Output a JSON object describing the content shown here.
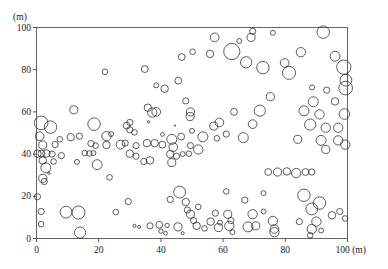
{
  "figure": {
    "type": "bubble-scatter",
    "y_axis_unit_label": "(m)",
    "x_axis_end_label": "100 (m)"
  },
  "axes": {
    "y_ticks": [
      {
        "value": 0,
        "label": "0"
      },
      {
        "value": 20,
        "label": "20"
      },
      {
        "value": 40,
        "label": "40"
      },
      {
        "value": 60,
        "label": "60"
      },
      {
        "value": 80,
        "label": "80"
      },
      {
        "value": 100,
        "label": "100"
      }
    ],
    "x_ticks": [
      {
        "value": 0,
        "label": "0"
      },
      {
        "value": 20,
        "label": "20"
      },
      {
        "value": 40,
        "label": "40"
      },
      {
        "value": 60,
        "label": "60"
      },
      {
        "value": 80,
        "label": "80"
      },
      {
        "value": 100,
        "label": "100 (m)"
      }
    ]
  },
  "chart_data": {
    "type": "scatter",
    "title": "",
    "subtitle": "",
    "xlabel": "(m)",
    "ylabel": "(m)",
    "xlim": [
      0,
      100
    ],
    "ylim": [
      0,
      100
    ],
    "grid": false,
    "legend": null,
    "marker": {
      "shape": "circle",
      "fill": "none",
      "stroke": "#1a1a1a",
      "stroke_width": 0.7,
      "size_encodes": "crown-diameter",
      "size_min_m": 0.6,
      "size_max_m": 4.4
    },
    "axis_unit": "m",
    "point_fields": [
      "x",
      "y",
      "r"
    ],
    "points": [
      [
        69.5,
        98.2,
        1.0
      ],
      [
        69.0,
        95.3,
        1.3
      ],
      [
        76.0,
        97.5,
        0.8
      ],
      [
        92.2,
        97.8,
        2.0
      ],
      [
        57.3,
        95.3,
        1.4
      ],
      [
        65.2,
        93.6,
        0.8
      ],
      [
        55.8,
        87.5,
        1.2
      ],
      [
        62.8,
        88.6,
        2.6
      ],
      [
        46.7,
        86.0,
        1.1
      ],
      [
        50.2,
        88.5,
        0.9
      ],
      [
        85.0,
        88.3,
        1.5
      ],
      [
        96.0,
        86.4,
        1.6
      ],
      [
        67.4,
        83.5,
        1.8
      ],
      [
        72.8,
        81.0,
        2.0
      ],
      [
        79.8,
        83.2,
        1.4
      ],
      [
        34.8,
        80.3,
        1.1
      ],
      [
        81.2,
        78.5,
        2.1
      ],
      [
        98.8,
        81.2,
        2.3
      ],
      [
        22.0,
        79.0,
        0.9
      ],
      [
        45.6,
        74.8,
        1.1
      ],
      [
        99.5,
        75.0,
        1.9
      ],
      [
        99.4,
        71.3,
        2.2
      ],
      [
        41.2,
        71.0,
        1.2
      ],
      [
        38.5,
        72.6,
        0.8
      ],
      [
        88.6,
        71.6,
        0.8
      ],
      [
        93.3,
        70.3,
        1.0
      ],
      [
        75.2,
        67.2,
        1.3
      ],
      [
        48.0,
        65.2,
        1.0
      ],
      [
        89.0,
        64.8,
        1.6
      ],
      [
        96.0,
        65.0,
        1.2
      ],
      [
        12.0,
        61.0,
        1.3
      ],
      [
        35.8,
        62.0,
        1.2
      ],
      [
        37.2,
        59.7,
        1.5
      ],
      [
        38.5,
        60.0,
        1.4
      ],
      [
        49.5,
        60.0,
        1.3
      ],
      [
        49.4,
        57.8,
        1.3
      ],
      [
        63.5,
        60.0,
        1.1
      ],
      [
        71.8,
        60.6,
        1.8
      ],
      [
        86.0,
        60.5,
        1.6
      ],
      [
        91.0,
        58.8,
        1.5
      ],
      [
        99.0,
        59.0,
        1.7
      ],
      [
        1.5,
        54.8,
        2.2
      ],
      [
        4.5,
        52.8,
        2.0
      ],
      [
        18.5,
        54.2,
        2.0
      ],
      [
        29.0,
        53.5,
        1.1
      ],
      [
        30.0,
        55.0,
        1.0
      ],
      [
        36.0,
        55.3,
        0.4
      ],
      [
        44.5,
        53.5,
        0.2
      ],
      [
        57.0,
        53.3,
        1.3
      ],
      [
        58.8,
        55.0,
        1.4
      ],
      [
        69.5,
        54.2,
        1.4
      ],
      [
        88.0,
        54.0,
        1.8
      ],
      [
        93.0,
        52.5,
        1.5
      ],
      [
        97.0,
        52.5,
        1.5
      ],
      [
        30.0,
        51.5,
        1.0
      ],
      [
        31.5,
        50.3,
        0.9
      ],
      [
        40.5,
        49.3,
        0.6
      ],
      [
        50.0,
        51.0,
        0.8
      ],
      [
        61.0,
        49.5,
        1.0
      ],
      [
        1.0,
        48.5,
        1.4
      ],
      [
        11.0,
        48.0,
        1.2
      ],
      [
        13.8,
        48.5,
        1.0
      ],
      [
        7.5,
        47.0,
        0.9
      ],
      [
        22.5,
        48.5,
        1.5
      ],
      [
        24.0,
        49.5,
        0.8
      ],
      [
        43.5,
        47.0,
        1.6
      ],
      [
        46.5,
        48.3,
        1.1
      ],
      [
        53.5,
        48.2,
        1.6
      ],
      [
        58.0,
        47.5,
        0.9
      ],
      [
        66.5,
        47.8,
        1.6
      ],
      [
        84.0,
        47.0,
        1.3
      ],
      [
        91.5,
        46.5,
        1.6
      ],
      [
        97.0,
        46.5,
        1.5
      ],
      [
        99.3,
        44.5,
        1.5
      ],
      [
        2.0,
        44.3,
        1.3
      ],
      [
        6.0,
        44.5,
        1.0
      ],
      [
        17.5,
        45.0,
        1.0
      ],
      [
        19.0,
        44.0,
        0.9
      ],
      [
        22.5,
        44.3,
        1.2
      ],
      [
        27.0,
        44.5,
        1.4
      ],
      [
        28.5,
        45.2,
        1.0
      ],
      [
        32.0,
        44.0,
        1.0
      ],
      [
        35.5,
        45.2,
        1.2
      ],
      [
        38.0,
        45.2,
        1.2
      ],
      [
        40.5,
        44.5,
        1.1
      ],
      [
        44.0,
        43.3,
        1.4
      ],
      [
        49.5,
        44.0,
        1.0
      ],
      [
        52.0,
        42.2,
        1.5
      ],
      [
        93.0,
        42.2,
        1.3
      ],
      [
        0.3,
        40.2,
        1.2
      ],
      [
        1.6,
        40.2,
        1.1
      ],
      [
        3.2,
        40.3,
        1.2
      ],
      [
        5.0,
        40.0,
        1.0
      ],
      [
        8.0,
        39.3,
        1.0
      ],
      [
        15.5,
        40.5,
        0.9
      ],
      [
        17.0,
        40.3,
        0.9
      ],
      [
        18.3,
        40.5,
        0.8
      ],
      [
        30.0,
        40.2,
        1.2
      ],
      [
        32.0,
        39.0,
        1.0
      ],
      [
        43.0,
        40.0,
        1.2
      ],
      [
        45.0,
        39.0,
        1.0
      ],
      [
        47.0,
        40.0,
        0.8
      ],
      [
        49.0,
        40.2,
        0.9
      ],
      [
        2.0,
        37.0,
        1.2
      ],
      [
        5.5,
        36.5,
        0.9
      ],
      [
        13.0,
        36.3,
        0.8
      ],
      [
        19.5,
        35.0,
        1.6
      ],
      [
        34.5,
        36.5,
        1.0
      ],
      [
        36.5,
        37.0,
        1.2
      ],
      [
        43.5,
        36.0,
        1.3
      ],
      [
        3.0,
        33.5,
        1.6
      ],
      [
        4.0,
        31.0,
        0.4
      ],
      [
        74.5,
        31.5,
        1.1
      ],
      [
        77.5,
        31.5,
        1.3
      ],
      [
        80.5,
        31.8,
        1.2
      ],
      [
        83.5,
        31.0,
        1.5
      ],
      [
        86.5,
        31.5,
        1.1
      ],
      [
        88.5,
        31.5,
        1.0
      ],
      [
        2.0,
        28.5,
        1.3
      ],
      [
        2.5,
        27.0,
        1.0
      ],
      [
        23.5,
        29.0,
        0.9
      ],
      [
        0.3,
        19.8,
        1.0
      ],
      [
        46.0,
        22.0,
        1.9
      ],
      [
        61.0,
        22.3,
        0.9
      ],
      [
        73.0,
        21.5,
        0.8
      ],
      [
        86.0,
        20.5,
        2.0
      ],
      [
        29.5,
        17.5,
        1.0
      ],
      [
        43.0,
        18.5,
        1.0
      ],
      [
        48.0,
        17.3,
        1.2
      ],
      [
        67.0,
        18.2,
        1.0
      ],
      [
        91.0,
        16.8,
        2.0
      ],
      [
        52.0,
        15.0,
        0.9
      ],
      [
        88.5,
        14.0,
        1.9
      ],
      [
        1.5,
        12.8,
        1.0
      ],
      [
        9.5,
        12.5,
        1.9
      ],
      [
        13.5,
        12.3,
        2.1
      ],
      [
        25.5,
        12.5,
        0.9
      ],
      [
        48.5,
        13.5,
        1.0
      ],
      [
        49.5,
        11.5,
        1.3
      ],
      [
        57.5,
        12.0,
        1.0
      ],
      [
        61.5,
        11.5,
        1.3
      ],
      [
        69.5,
        11.5,
        1.5
      ],
      [
        73.0,
        12.8,
        0.8
      ],
      [
        95.0,
        11.0,
        1.2
      ],
      [
        97.5,
        12.8,
        1.0
      ],
      [
        99.2,
        9.5,
        0.9
      ],
      [
        50.5,
        8.5,
        1.0
      ],
      [
        56.0,
        8.0,
        1.2
      ],
      [
        59.0,
        7.5,
        0.8
      ],
      [
        62.5,
        8.5,
        1.0
      ],
      [
        76.0,
        8.3,
        1.5
      ],
      [
        84.5,
        8.0,
        1.0
      ],
      [
        90.0,
        8.0,
        1.5
      ],
      [
        1.5,
        6.8,
        0.9
      ],
      [
        31.5,
        6.0,
        0.5
      ],
      [
        33.0,
        5.5,
        0.5
      ],
      [
        36.5,
        6.0,
        1.0
      ],
      [
        39.5,
        6.5,
        1.1
      ],
      [
        42.0,
        6.2,
        0.7
      ],
      [
        45.5,
        5.5,
        1.3
      ],
      [
        51.5,
        6.0,
        1.2
      ],
      [
        54.0,
        4.8,
        0.9
      ],
      [
        58.5,
        5.2,
        1.3
      ],
      [
        62.0,
        6.0,
        1.5
      ],
      [
        68.0,
        5.5,
        1.6
      ],
      [
        70.5,
        6.0,
        1.3
      ],
      [
        76.5,
        4.5,
        1.4
      ],
      [
        76.5,
        3.0,
        1.5
      ],
      [
        88.5,
        4.5,
        1.5
      ],
      [
        91.5,
        3.8,
        0.8
      ],
      [
        14.0,
        2.8,
        1.8
      ],
      [
        40.0,
        3.5,
        0.7
      ],
      [
        41.5,
        2.5,
        0.6
      ],
      [
        47.0,
        2.5,
        0.5
      ],
      [
        63.0,
        3.0,
        0.8
      ],
      [
        88.0,
        1.5,
        0.9
      ]
    ]
  }
}
